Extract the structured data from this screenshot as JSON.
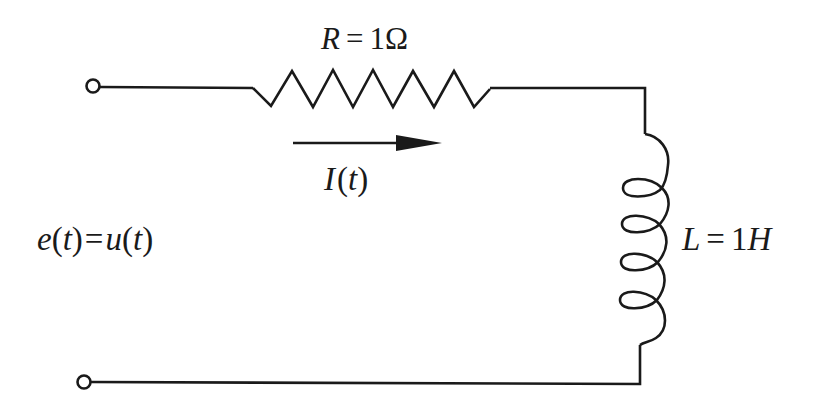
{
  "diagram": {
    "type": "RL series circuit",
    "resistor": {
      "label_symbol": "R",
      "label_equals": "=",
      "label_value": "1",
      "label_unit": "Ω"
    },
    "inductor": {
      "label_symbol": "L",
      "label_equals": "=",
      "label_value": "1",
      "label_unit": "H",
      "turns": 4
    },
    "current": {
      "label_symbol": "I",
      "label_open": "(",
      "label_var": "t",
      "label_close": ")",
      "direction": "right"
    },
    "source": {
      "lhs_func": "e",
      "lhs_open": "(",
      "lhs_var": "t",
      "lhs_close": ")",
      "equals": "=",
      "rhs_func": "u",
      "rhs_open": "(",
      "rhs_var": "t",
      "rhs_close": ")"
    },
    "terminals": [
      "top-terminal",
      "bottom-terminal"
    ],
    "colors": {
      "stroke": "#1a1a1a",
      "background": "#ffffff"
    }
  }
}
